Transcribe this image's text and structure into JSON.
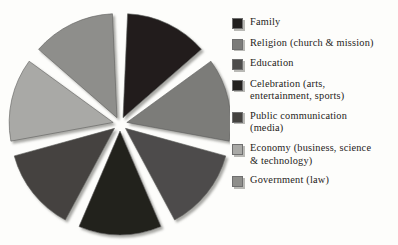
{
  "chart_data": {
    "type": "pie",
    "title": "",
    "subtitle": "",
    "exploded": true,
    "legend_position": "right",
    "grid": false,
    "categories": [
      "Family",
      "Religion (church & mission)",
      "Education",
      "Celebration (arts, entertainment, sports)",
      "Public communication (media)",
      "Economy (business, science & technology)",
      "Government (law)"
    ],
    "values": [
      14.29,
      14.29,
      14.29,
      14.29,
      14.29,
      14.29,
      14.29
    ],
    "value_unit": "percent",
    "slice_colors": [
      "#211f1e",
      "#7b7b79",
      "#4d4c4b",
      "#24221f",
      "#44423f",
      "#a9a9a6",
      "#8e8e8b"
    ],
    "slice_count": 7,
    "start_angle_deg": 0,
    "sweep_per_slice_deg": 51.43
  },
  "legend": {
    "items": [
      {
        "label": "Family",
        "color": "#211f1e"
      },
      {
        "label": "Religion (church & mission)",
        "color": "#7b7b79"
      },
      {
        "label": "Education",
        "color": "#4d4c4b"
      },
      {
        "label": "Celebration (arts,\nentertainment, sports)",
        "color": "#24221f"
      },
      {
        "label": "Public communication\n(media)",
        "color": "#44423f"
      },
      {
        "label": "Economy (business, science\n& technology)",
        "color": "#a9a9a6"
      },
      {
        "label": "Government (law)",
        "color": "#8e8e8b"
      }
    ]
  }
}
